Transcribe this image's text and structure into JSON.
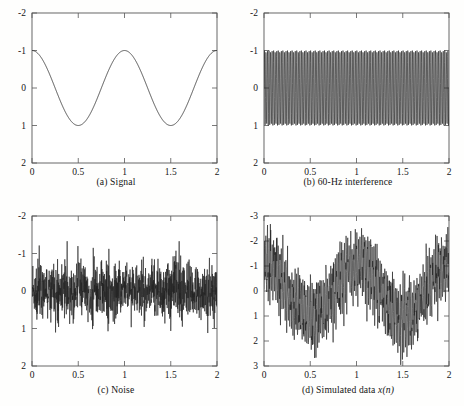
{
  "figure": {
    "title": "",
    "layout": "2x2 grid of signal plots",
    "background_color": "#fefefd",
    "trace_color": "#222222",
    "axis_color": "#575757"
  },
  "panels": [
    {
      "id": "a",
      "caption": "(a) Signal",
      "caption_prefix": "(a) Signal",
      "caption_italic": "",
      "xlabel": "",
      "ylabel": "",
      "xticks": [
        "0",
        "0.5",
        "1",
        "1.5",
        "2"
      ],
      "yticks": [
        "2",
        "1",
        "0",
        "-1",
        "-2"
      ]
    },
    {
      "id": "b",
      "caption": "(b) 60-Hz interference",
      "caption_prefix": "(b) 60-Hz interference",
      "caption_italic": "",
      "xlabel": "",
      "ylabel": "",
      "xticks": [
        "0",
        "0.5",
        "1",
        "1.5",
        "2"
      ],
      "yticks": [
        "2",
        "1",
        "0",
        "-1",
        "-2"
      ]
    },
    {
      "id": "c",
      "caption": "(c) Noise",
      "caption_prefix": "(c) Noise",
      "caption_italic": "",
      "xlabel": "",
      "ylabel": "",
      "xticks": [
        "0",
        "0.5",
        "1",
        "1.5",
        "2"
      ],
      "yticks": [
        "2",
        "1",
        "0",
        "-1",
        "-2"
      ]
    },
    {
      "id": "d",
      "caption": "(d) Simulated data x(n)",
      "caption_prefix": "(d) Simulated data ",
      "caption_italic": "x(n)",
      "xlabel": "",
      "ylabel": "",
      "xticks": [
        "0",
        "0.5",
        "1",
        "1.5",
        "2"
      ],
      "yticks": [
        "3",
        "2",
        "1",
        "0",
        "-1",
        "-2",
        "-3"
      ]
    }
  ],
  "chart_data": [
    {
      "type": "line",
      "panel": "a",
      "title": "(a) Signal",
      "xlabel": "",
      "ylabel": "",
      "xlim": [
        0,
        2
      ],
      "ylim": [
        -2,
        2
      ],
      "xticks": [
        0,
        0.5,
        1,
        1.5,
        2
      ],
      "yticks": [
        -2,
        -1,
        0,
        1,
        2
      ],
      "grid": false,
      "legend": "none",
      "series": [
        {
          "name": "signal",
          "formula": "cos(2*pi*t)",
          "amplitude": 1,
          "frequency_hz": 1,
          "cycles_shown": 2,
          "n_samples": 1000,
          "description": "Clean 1 Hz cosine, amplitude 1, peaks at t=0,1,2 and troughs at t=0.5,1.5"
        }
      ]
    },
    {
      "type": "line",
      "panel": "b",
      "title": "(b) 60-Hz interference",
      "xlabel": "",
      "ylabel": "",
      "xlim": [
        0,
        2
      ],
      "ylim": [
        -2,
        2
      ],
      "xticks": [
        0,
        0.5,
        1,
        1.5,
        2
      ],
      "yticks": [
        -2,
        -1,
        0,
        1,
        2
      ],
      "grid": false,
      "legend": "none",
      "series": [
        {
          "name": "interference",
          "formula": "sin(2*pi*60*t)",
          "amplitude": 1,
          "frequency_hz": 60,
          "cycles_shown": 120,
          "n_samples": 1000,
          "description": "Dense 60 Hz sinusoid filling the band between -1 and +1"
        }
      ]
    },
    {
      "type": "line",
      "panel": "c",
      "title": "(c) Noise",
      "xlabel": "",
      "ylabel": "",
      "xlim": [
        0,
        2
      ],
      "ylim": [
        -2,
        2
      ],
      "xticks": [
        0,
        0.5,
        1,
        1.5,
        2
      ],
      "yticks": [
        -2,
        -1,
        0,
        1,
        2
      ],
      "grid": false,
      "legend": "none",
      "series": [
        {
          "name": "noise",
          "formula": "white gaussian noise",
          "std_dev": 0.4,
          "mean": 0,
          "peak_abs": 1.55,
          "n_samples": 1000,
          "description": "Zero-mean white Gaussian noise, std approx 0.4, extremes near +/-1.5"
        }
      ]
    },
    {
      "type": "line",
      "panel": "d",
      "title": "(d) Simulated data x(n)",
      "xlabel": "",
      "ylabel": "",
      "xlim": [
        0,
        2
      ],
      "ylim": [
        -3,
        3
      ],
      "xticks": [
        0,
        0.5,
        1,
        1.5,
        2
      ],
      "yticks": [
        -3,
        -2,
        -1,
        0,
        1,
        2,
        3
      ],
      "grid": false,
      "legend": "none",
      "series": [
        {
          "name": "x(n)",
          "formula": "cos(2*pi*t) + sin(2*pi*60*t) + noise",
          "amplitude_envelope": 3,
          "n_samples": 1000,
          "description": "Sum of 1 Hz cosine, 60 Hz interference and noise; envelope swings between -3 and +3 following the cosine"
        }
      ]
    }
  ]
}
